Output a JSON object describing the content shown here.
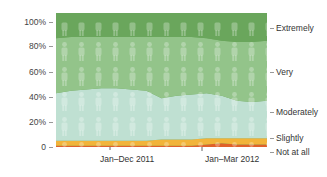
{
  "chart_data": {
    "type": "area",
    "stacked": true,
    "percent": true,
    "title": "",
    "xlabel": "",
    "ylabel": "",
    "ylim": [
      0,
      100
    ],
    "yticks": [
      "100%",
      "80%",
      "60%",
      "40%",
      "20%",
      "0"
    ],
    "xticks": [
      "Jan–Dec 2011",
      "Jan–Mar 2012"
    ],
    "x": [
      0,
      1,
      2,
      3,
      4,
      5,
      6,
      7,
      8,
      9,
      10,
      11,
      12,
      13,
      14
    ],
    "series": [
      {
        "name": "Not at all",
        "color": "#e0612a",
        "values": [
          1,
          1,
          1,
          1,
          1,
          1,
          1,
          1,
          1,
          1,
          2,
          3,
          2,
          2,
          2
        ]
      },
      {
        "name": "Slightly",
        "color": "#f2b43a",
        "values": [
          4,
          4,
          4,
          4,
          4,
          4,
          4,
          5,
          5,
          5,
          5,
          4,
          5,
          5,
          5
        ]
      },
      {
        "name": "Moderately",
        "color": "#bfe0d2",
        "values": [
          38,
          40,
          41,
          42,
          42,
          41,
          40,
          33,
          35,
          36,
          36,
          34,
          30,
          29,
          30
        ]
      },
      {
        "name": "Very",
        "color": "#93c48a",
        "values": [
          44,
          43,
          42,
          41,
          41,
          42,
          43,
          49,
          47,
          46,
          44,
          44,
          47,
          48,
          48
        ]
      },
      {
        "name": "Extremely",
        "color": "#6aa65c",
        "values": [
          13,
          12,
          12,
          12,
          12,
          12,
          12,
          12,
          12,
          12,
          13,
          15,
          16,
          16,
          15
        ]
      }
    ],
    "legend_position": "right",
    "grid": false
  },
  "axis": {
    "y_labels": [
      "100%",
      "80%",
      "60%",
      "40%",
      "20%",
      "0"
    ]
  },
  "legend": {
    "items": [
      "Extremely",
      "Very",
      "Moderately",
      "Slightly",
      "Not at all"
    ]
  },
  "x_labels": [
    "Jan–Dec 2011",
    "Jan–Mar 2012"
  ]
}
